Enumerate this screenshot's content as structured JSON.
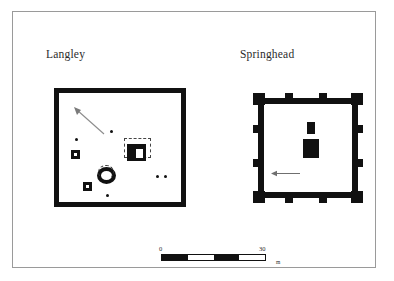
{
  "figure": {
    "type": "archaeological-site-plan-pair",
    "frame_color": "#9a9a9a",
    "ink_color": "#111111",
    "background": "#ffffff"
  },
  "plans": [
    {
      "id": "langley",
      "label": "Langley",
      "enclosure": "rectangular ditched enclosure",
      "features": {
        "north_arrow": "north-arrow-icon",
        "dots": 5,
        "square_barrows": 2,
        "circular_shrine": "ring",
        "temple": "romano-celtic temple within dashed temenos"
      }
    },
    {
      "id": "springhead",
      "label": "Springhead",
      "enclosure": "square walled enclosure with corner and interval towers",
      "features": {
        "direction_arrow": "west-arrow-icon",
        "buildings": 2,
        "corner_towers": 4,
        "interval_towers": 8
      }
    }
  ],
  "scale": {
    "min_label": "0",
    "max_label": "30",
    "unit": "m",
    "segments": 4
  }
}
